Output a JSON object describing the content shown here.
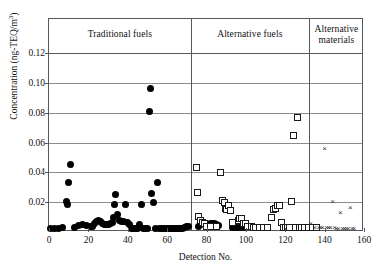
{
  "chart_data": {
    "type": "scatter",
    "title": "",
    "xlabel": "Detection No.",
    "ylabel": "Concentration (ng-TEQ/m3)",
    "ylabel_parts": {
      "main": "Concentration  (ng-TEQ/m",
      "sup": "3",
      "tail": ")"
    },
    "xlim": [
      0,
      160
    ],
    "ylim": [
      0,
      0.12
    ],
    "xticks": [
      0,
      20,
      40,
      60,
      80,
      100,
      120,
      140,
      160
    ],
    "xticklabels": [
      "0",
      "20",
      "40",
      "60",
      "80",
      "100",
      "120",
      "140",
      "160"
    ],
    "yticks": [
      0.02,
      0.04,
      0.06,
      0.08,
      0.1,
      0.12
    ],
    "yticklabels": [
      "0.02",
      "0.04",
      "0.06",
      "0.08",
      "0.10",
      "0.12"
    ],
    "grid": "horizontal",
    "legend_position": "none",
    "panel_dividers": [
      72,
      132
    ],
    "panels": [
      {
        "label": "Traditional fuels",
        "x_start": 0,
        "x_end": 72
      },
      {
        "label": "Alternative fuels",
        "x_start": 72,
        "x_end": 132
      },
      {
        "label": "Alternative materials",
        "x_start": 132,
        "x_end": 160
      }
    ],
    "series": [
      {
        "name": "Traditional fuels",
        "marker": "filled-circle",
        "color": "#000000",
        "points": [
          [
            1,
            0.0025
          ],
          [
            3,
            0.0025
          ],
          [
            5,
            0.0025
          ],
          [
            7,
            0.0027
          ],
          [
            9,
            0.0205
          ],
          [
            9.5,
            0.0185
          ],
          [
            10,
            0.0335
          ],
          [
            11,
            0.045
          ],
          [
            13,
            0.003
          ],
          [
            15,
            0.0042
          ],
          [
            17,
            0.0048
          ],
          [
            19,
            0.0042
          ],
          [
            21,
            0.004
          ],
          [
            22,
            0.0035
          ],
          [
            23,
            0.006
          ],
          [
            24,
            0.0072
          ],
          [
            25,
            0.0075
          ],
          [
            26,
            0.007
          ],
          [
            27,
            0.006
          ],
          [
            28,
            0.0052
          ],
          [
            29,
            0.0048
          ],
          [
            30,
            0.005
          ],
          [
            31,
            0.0058
          ],
          [
            32,
            0.0065
          ],
          [
            33,
            0.0098
          ],
          [
            33.5,
            0.0185
          ],
          [
            34,
            0.025
          ],
          [
            35,
            0.012
          ],
          [
            36,
            0.008
          ],
          [
            37,
            0.007
          ],
          [
            38,
            0.0072
          ],
          [
            39,
            0.0185
          ],
          [
            40,
            0.0062
          ],
          [
            41,
            0.0048
          ],
          [
            42,
            0.0026
          ],
          [
            43,
            0.0026
          ],
          [
            44,
            0.0026
          ],
          [
            45,
            0.0026
          ],
          [
            46,
            0.005
          ],
          [
            47,
            0.0185
          ],
          [
            48,
            0.0026
          ],
          [
            49,
            0.0026
          ],
          [
            50,
            0.0026
          ],
          [
            51,
            0.0805
          ],
          [
            51.5,
            0.0965
          ],
          [
            52,
            0.0255
          ],
          [
            53,
            0.02
          ],
          [
            54,
            0.0026
          ],
          [
            55,
            0.0335
          ],
          [
            56,
            0.0026
          ],
          [
            57,
            0.0026
          ],
          [
            58,
            0.0026
          ],
          [
            59,
            0.0026
          ],
          [
            60,
            0.0026
          ],
          [
            61,
            0.0026
          ],
          [
            62,
            0.0026
          ],
          [
            63,
            0.0026
          ],
          [
            64,
            0.0026
          ],
          [
            65,
            0.0026
          ],
          [
            66,
            0.0026
          ],
          [
            67,
            0.0026
          ],
          [
            68,
            0.0026
          ],
          [
            69,
            0.003
          ],
          [
            70,
            0.0034
          ],
          [
            71,
            0.0038
          ],
          [
            76,
            0.004
          ],
          [
            77,
            0.005
          ],
          [
            80,
            0.0042
          ],
          [
            82,
            0.0055
          ],
          [
            83,
            0.0058
          ],
          [
            84,
            0.006
          ],
          [
            85,
            0.005
          ],
          [
            86,
            0.0042
          ],
          [
            93,
            0.0028
          ],
          [
            95,
            0.0028
          ],
          [
            97,
            0.003
          ],
          [
            99,
            0.003
          ]
        ]
      },
      {
        "name": "Alternative fuels",
        "marker": "open-square",
        "color": "#1a1a1a",
        "points": [
          [
            75,
            0.043
          ],
          [
            75.5,
            0.0265
          ],
          [
            76,
            0.0105
          ],
          [
            77,
            0.0078
          ],
          [
            78,
            0.0062
          ],
          [
            79,
            0.0058
          ],
          [
            80,
            0.004
          ],
          [
            82,
            0.0035
          ],
          [
            85,
            0.0035
          ],
          [
            87,
            0.04
          ],
          [
            88,
            0.021
          ],
          [
            89,
            0.0195
          ],
          [
            89.5,
            0.016
          ],
          [
            90,
            0.015
          ],
          [
            91,
            0.018
          ],
          [
            92,
            0.0145
          ],
          [
            93,
            0.0062
          ],
          [
            96,
            0.008
          ],
          [
            97,
            0.0092
          ],
          [
            98,
            0.009
          ],
          [
            99,
            0.006
          ],
          [
            100,
            0.0055
          ],
          [
            101,
            0.004
          ],
          [
            103,
            0.0035
          ],
          [
            104,
            0.0032
          ],
          [
            105,
            0.003
          ],
          [
            107,
            0.003
          ],
          [
            109,
            0.0028
          ],
          [
            111,
            0.0028
          ],
          [
            113,
            0.0095
          ],
          [
            114,
            0.015
          ],
          [
            115,
            0.016
          ],
          [
            116,
            0.0175
          ],
          [
            117,
            0.018
          ],
          [
            118,
            0.0065
          ],
          [
            119,
            0.0032
          ],
          [
            120,
            0.003
          ],
          [
            121,
            0.0032
          ],
          [
            122,
            0.003
          ],
          [
            123,
            0.0205
          ],
          [
            124,
            0.065
          ],
          [
            125,
            0.003
          ],
          [
            126,
            0.077
          ],
          [
            127,
            0.003
          ],
          [
            128,
            0.003
          ],
          [
            130,
            0.003
          ],
          [
            132,
            0.003
          ],
          [
            134,
            0.0028
          ],
          [
            136,
            0.0028
          ]
        ]
      },
      {
        "name": "Alternative materials",
        "marker": "cross",
        "color": "#333333",
        "points": [
          [
            133,
            0.0058
          ],
          [
            135,
            0.003
          ],
          [
            137,
            0.003
          ],
          [
            138,
            0.0028
          ],
          [
            139,
            0.0028
          ],
          [
            140,
            0.056
          ],
          [
            141,
            0.0028
          ],
          [
            142,
            0.0028
          ],
          [
            143,
            0.003
          ],
          [
            144,
            0.0205
          ],
          [
            145,
            0.0028
          ],
          [
            146,
            0.0026
          ],
          [
            147,
            0.0026
          ],
          [
            148,
            0.013
          ],
          [
            149,
            0.0026
          ],
          [
            150,
            0.0026
          ],
          [
            151,
            0.0026
          ],
          [
            152,
            0.0026
          ],
          [
            153,
            0.0165
          ],
          [
            154,
            0.0026
          ],
          [
            155,
            0.0026
          ]
        ]
      }
    ]
  }
}
